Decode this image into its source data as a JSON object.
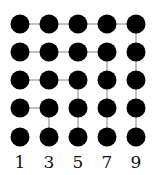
{
  "diagram": {
    "columns": [
      20,
      49,
      78,
      107,
      136
    ],
    "rows": [
      24,
      52,
      80,
      108,
      137
    ],
    "radius": 9.5,
    "dot_color": "#000000",
    "line_color": "#9a9a9a",
    "labels": [
      "1",
      "3",
      "5",
      "7",
      "9"
    ],
    "edges": [
      [
        [
          0,
          0
        ],
        [
          1,
          0
        ]
      ],
      [
        [
          1,
          0
        ],
        [
          2,
          0
        ]
      ],
      [
        [
          2,
          0
        ],
        [
          3,
          0
        ]
      ],
      [
        [
          3,
          0
        ],
        [
          4,
          0
        ]
      ],
      [
        [
          4,
          0
        ],
        [
          4,
          1
        ]
      ],
      [
        [
          4,
          1
        ],
        [
          4,
          2
        ]
      ],
      [
        [
          4,
          2
        ],
        [
          4,
          3
        ]
      ],
      [
        [
          4,
          3
        ],
        [
          4,
          4
        ]
      ],
      [
        [
          0,
          1
        ],
        [
          1,
          1
        ]
      ],
      [
        [
          1,
          1
        ],
        [
          2,
          1
        ]
      ],
      [
        [
          2,
          1
        ],
        [
          3,
          1
        ]
      ],
      [
        [
          3,
          1
        ],
        [
          3,
          2
        ]
      ],
      [
        [
          3,
          2
        ],
        [
          3,
          3
        ]
      ],
      [
        [
          3,
          3
        ],
        [
          3,
          4
        ]
      ],
      [
        [
          0,
          2
        ],
        [
          1,
          2
        ]
      ],
      [
        [
          1,
          2
        ],
        [
          2,
          2
        ]
      ],
      [
        [
          2,
          2
        ],
        [
          2,
          3
        ]
      ],
      [
        [
          2,
          3
        ],
        [
          2,
          4
        ]
      ],
      [
        [
          0,
          3
        ],
        [
          1,
          3
        ]
      ],
      [
        [
          1,
          3
        ],
        [
          1,
          4
        ]
      ]
    ]
  }
}
